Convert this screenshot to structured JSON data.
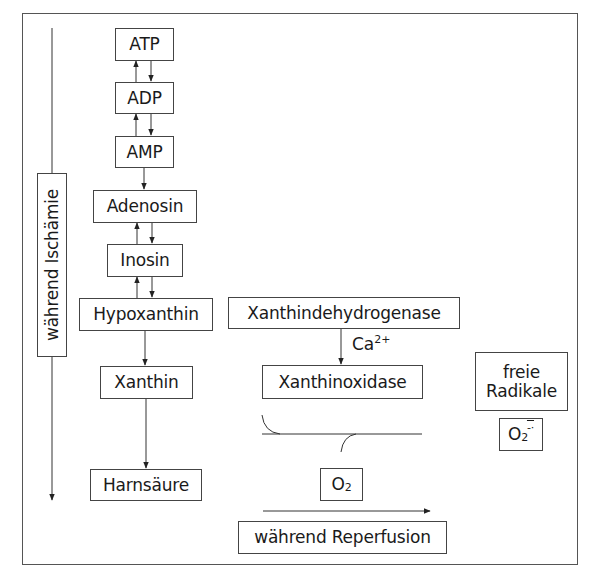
{
  "diagram": {
    "type": "biochemical-pathway",
    "phases": {
      "ischemia": {
        "label": "während Ischämie",
        "direction": "down"
      },
      "reperfusion": {
        "label": "während Reperfusion",
        "direction": "right"
      }
    },
    "pathway": [
      {
        "id": "atp",
        "label": "ATP"
      },
      {
        "id": "adp",
        "label": "ADP"
      },
      {
        "id": "amp",
        "label": "AMP"
      },
      {
        "id": "adenosin",
        "label": "Adenosin"
      },
      {
        "id": "inosin",
        "label": "Inosin"
      },
      {
        "id": "hypoxanthin",
        "label": "Hypoxanthin"
      },
      {
        "id": "xanthin",
        "label": "Xanthin"
      },
      {
        "id": "harnsaeure",
        "label": "Harnsäure"
      }
    ],
    "enzymes": {
      "dehydrogenase": "Xanthindehydrogenase",
      "oxidase": "Xanthinoxidase",
      "cofactor": {
        "base": "Ca",
        "sup": "2+"
      }
    },
    "oxygen": {
      "base": "O",
      "sub": "2"
    },
    "radicals": {
      "line1": "freie",
      "line2": "Radikale",
      "superoxide": {
        "base": "O",
        "sub": "2",
        "sup": "-·"
      }
    },
    "edges": [
      {
        "from": "ATP",
        "to": "ADP",
        "type": "reversible"
      },
      {
        "from": "ADP",
        "to": "AMP",
        "type": "reversible"
      },
      {
        "from": "AMP",
        "to": "Adenosin",
        "type": "forward"
      },
      {
        "from": "Adenosin",
        "to": "Inosin",
        "type": "reversible"
      },
      {
        "from": "Inosin",
        "to": "Hypoxanthin",
        "type": "reversible"
      },
      {
        "from": "Hypoxanthin",
        "to": "Xanthin",
        "type": "forward"
      },
      {
        "from": "Xanthin",
        "to": "Harnsäure",
        "type": "forward"
      },
      {
        "from": "Xanthindehydrogenase",
        "to": "Xanthinoxidase",
        "type": "forward",
        "label": "Ca2+"
      },
      {
        "from": "O2",
        "to": "O2-·",
        "type": "reaction",
        "catalyst": "Xanthinoxidase"
      }
    ]
  }
}
